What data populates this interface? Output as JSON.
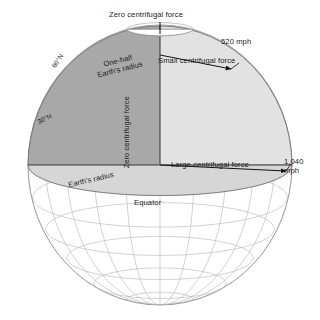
{
  "diagram": {
    "labels": {
      "zero_force_top": "Zero centrifugal force",
      "speed_60n": "520 mph",
      "small_force": "Small centrifugal force",
      "one_half_radius": "One-half\nEarth's radius",
      "one_half_radius_line1": "One-half",
      "one_half_radius_line2": "Earth's radius",
      "axis_vertical": "Zero centrifugal force",
      "latitude_60": "60°N",
      "latitude_30": "30°N",
      "earth_radius": "Earth's radius",
      "large_force": "Large centrifugal force",
      "speed_equator_line1": "1,040",
      "speed_equator_line2": "mph",
      "equator": "Equator"
    },
    "colors": {
      "background": "#ffffff",
      "globe_outline": "#8a8a8a",
      "graticule": "#b0b0b0",
      "wedge_dark": "#a8a8a8",
      "wedge_light": "#e2e2e2",
      "equatorial_disc": "#d6d6d6",
      "text": "#1a1a1a",
      "arrow": "#111111"
    },
    "geometry": {
      "globe_center_x": 160,
      "globe_center_y": 165,
      "globe_radius_x": 132,
      "globe_radius_y": 140,
      "graticule_spacing_degrees": 15
    },
    "speeds": [
      {
        "latitude": "60°N",
        "value": "520 mph",
        "force": "Small centrifugal force"
      },
      {
        "latitude": "Equator",
        "value": "1,040 mph",
        "force": "Large centrifugal force"
      },
      {
        "latitude": "Pole",
        "value": "0",
        "force": "Zero centrifugal force"
      }
    ]
  }
}
